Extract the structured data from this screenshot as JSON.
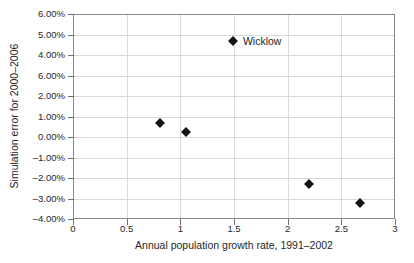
{
  "chart_data": {
    "type": "scatter",
    "title": "",
    "xlabel": "Annual population growth rate, 1991–2002",
    "ylabel": "Simulation error for 2000–2006",
    "xlim": [
      0,
      3
    ],
    "ylim": [
      -4,
      6
    ],
    "grid": true,
    "legend": "none",
    "x_ticks": [
      {
        "value": 0,
        "label": "0"
      },
      {
        "value": 0.5,
        "label": "0.5"
      },
      {
        "value": 1,
        "label": "1"
      },
      {
        "value": 1.5,
        "label": "1.5"
      },
      {
        "value": 2,
        "label": "2"
      },
      {
        "value": 2.5,
        "label": "2.5"
      },
      {
        "value": 3,
        "label": "3"
      }
    ],
    "y_ticks": [
      {
        "value": 6,
        "label": "6.00%"
      },
      {
        "value": 5,
        "label": "5.00%"
      },
      {
        "value": 4,
        "label": "4.00%"
      },
      {
        "value": 3,
        "label": "6.00%"
      },
      {
        "value": 2,
        "label": "2.00%"
      },
      {
        "value": 1,
        "label": "1.00%"
      },
      {
        "value": 0,
        "label": "0.00%"
      },
      {
        "value": -1,
        "label": "–1.00%"
      },
      {
        "value": -2,
        "label": "–2.00%"
      },
      {
        "value": -3,
        "label": "–3.00%"
      },
      {
        "value": -4,
        "label": "–4.00%"
      }
    ],
    "points": [
      {
        "x": 0.81,
        "y": 0.68,
        "label": ""
      },
      {
        "x": 1.05,
        "y": 0.23,
        "label": ""
      },
      {
        "x": 1.49,
        "y": 4.68,
        "label": "Wicklow"
      },
      {
        "x": 2.2,
        "y": -2.29,
        "label": ""
      },
      {
        "x": 2.67,
        "y": -3.2,
        "label": ""
      }
    ],
    "marker": {
      "shape": "diamond",
      "color": "#141414",
      "size": 9
    },
    "colors": {
      "background": "#ffffff",
      "plot_border": "#8a8a8a",
      "grid": "#d9d9d9",
      "text": "#262626"
    }
  }
}
